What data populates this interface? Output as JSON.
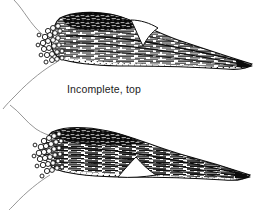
{
  "document": {
    "title": "Incomplete figures",
    "background_color": "#ffffff",
    "ink_color": "#111111",
    "style": "pen-and-ink scientific illustration"
  },
  "panels": [
    {
      "id": "top",
      "caption": "Incomplete, top",
      "specimen_name": "incomplete-top-specimen",
      "description": "Elongated wedge-shaped fibrous structure with bulbous cell cluster at left end, dense horizontal striations, dorsal notch near mid-body, tapering to a point at right",
      "features": {
        "cell_cluster": "open circles at left end",
        "striations": "horizontal fiber bundles",
        "notch": "dorsal notch",
        "tip": "tapered point at right",
        "guide_lines": "two thin curved outline strokes at left"
      }
    },
    {
      "id": "bottom",
      "caption": "Incomplete, bottom",
      "specimen_name": "incomplete-bottom-specimen",
      "description": "Elongated wedge-shaped fibrous structure with dense rounded cell cluster at left end, horizontal striations, ventral notch near mid-body, tapering to a point at right",
      "features": {
        "cell_cluster": "open circles at left end",
        "striations": "horizontal fiber bundles",
        "notch": "ventral notch",
        "tip": "tapered point at right",
        "guide_lines": "two thin curved outline strokes at left"
      }
    }
  ]
}
